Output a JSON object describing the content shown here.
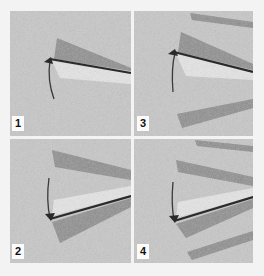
{
  "figure": {
    "background": "#f3f3f3",
    "panel_fill": "#c8c8c8",
    "gutter_color": "#ececec",
    "dark_band_color": "#8e8e8e",
    "light_wedge_color": "#e6e6e6",
    "line_color": "#2a2a2a",
    "arc_color": "#3a3a3a"
  },
  "panels": [
    {
      "label": "1",
      "rect": [
        10,
        11,
        121,
        125
      ],
      "label_pos": [
        12,
        116
      ],
      "apex": [
        50,
        59
      ],
      "line_end": [
        131,
        73
      ],
      "arc": "M54,99 Q47,80 50,60",
      "arrow": "M44,62 L51,57 L53,64 Z",
      "dark_bands": [
        "M54,59 L57,38 L131,68 L131,71 Z"
      ],
      "light_wedges": [
        "M52,61 L131,74 L131,84 L60,78 Z"
      ]
    },
    {
      "label": "3",
      "rect": [
        134,
        11,
        119,
        125
      ],
      "label_pos": [
        137,
        116
      ],
      "apex": [
        174,
        52
      ],
      "line_end": [
        253,
        72
      ],
      "arc": "M173,92 Q171,68 175,53",
      "arrow": "M168,54 L175,49 L178,56 Z",
      "dark_bands": [
        "M178,52 L181,32 L253,64 L253,70 Z",
        "M190,13 L192,20 L253,28 L253,22 Z",
        "M177,114 L182,128 L253,108 L253,99 Z"
      ],
      "light_wedges": [
        "M176,54 L253,73 L253,80 L186,76 Z"
      ]
    },
    {
      "label": "2",
      "rect": [
        10,
        139,
        121,
        124
      ],
      "label_pos": [
        12,
        244
      ],
      "apex": [
        50,
        219
      ],
      "line_end": [
        131,
        196
      ],
      "arc": "M49,178 Q46,200 50,218",
      "arrow": "M45,214 L51,221 L55,213 Z",
      "dark_bands": [
        "M52,150 L55,167 L131,180 L131,170 Z",
        "M52,222 L131,198 L131,207 L60,243 Z"
      ],
      "light_wedges": [
        "M52,216 L54,200 L131,186 L131,195 Z"
      ]
    },
    {
      "label": "4",
      "rect": [
        134,
        139,
        119,
        124
      ],
      "label_pos": [
        137,
        244
      ],
      "apex": [
        174,
        221
      ],
      "line_end": [
        253,
        197
      ],
      "arc": "M173,182 Q171,204 174,220",
      "arrow": "M169,216 L175,223 L179,215 Z",
      "dark_bands": [
        "M195,140 L197,146 L253,152 L253,146 Z",
        "M176,160 L178,172 L253,186 L253,177 Z",
        "M176,224 L253,199 L253,208 L186,238 Z",
        "M187,252 L192,260 L253,240 L253,231 Z"
      ],
      "light_wedges": [
        "M176,218 L178,202 L253,188 L253,196 Z"
      ]
    }
  ]
}
